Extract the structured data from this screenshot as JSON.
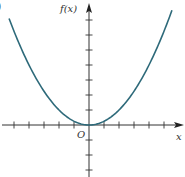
{
  "figure": {
    "corner_label": ")"
  },
  "chart_data": {
    "type": "line",
    "title": "",
    "function": "f(x) = x^2 / 4",
    "xlabel": "x",
    "ylabel": "f(x)",
    "origin_label": "O",
    "xlim": [
      -5.9,
      6.3
    ],
    "ylim": [
      -3.4,
      8.0
    ],
    "x_ticks": [
      -5,
      -4,
      -3,
      -2,
      -1,
      1,
      2,
      3,
      4,
      5
    ],
    "y_ticks": [
      -3,
      -2,
      -1,
      1,
      2,
      3,
      4,
      5,
      6,
      7
    ],
    "grid": false,
    "legend": null,
    "series": [
      {
        "name": "f(x)",
        "color": "#2e6a7a",
        "x": [
          -5.33,
          -5,
          -4,
          -3,
          -2,
          -1,
          0,
          1,
          2,
          3,
          4,
          5,
          5.53
        ],
        "y": [
          7.1,
          6.25,
          4.0,
          2.25,
          1.0,
          0.25,
          0,
          0.25,
          1.0,
          2.25,
          4.0,
          6.25,
          7.65
        ]
      }
    ],
    "axis_color": "#333333"
  }
}
